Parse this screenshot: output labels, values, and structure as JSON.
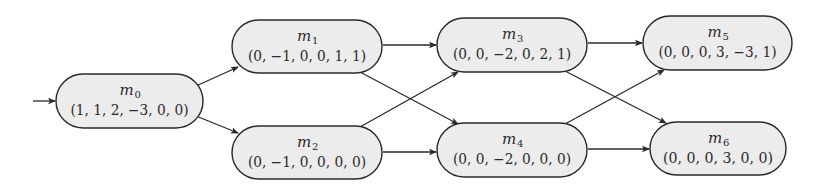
{
  "diagram": {
    "colors": {
      "node_fill": "#ececec",
      "stroke": "#2a2a2a",
      "background": "#ffffff"
    },
    "initial_node": "m0",
    "nodes": [
      {
        "id": "m0",
        "name": "m",
        "sub": "0",
        "vector": "(1, 1, 2, −3, 0, 0)",
        "x": 56,
        "y": 74,
        "w": 147,
        "h": 54
      },
      {
        "id": "m1",
        "name": "m",
        "sub": "1",
        "vector": "(0, −1, 0, 0, 1, 1)",
        "x": 232,
        "y": 20,
        "w": 150,
        "h": 53
      },
      {
        "id": "m2",
        "name": "m",
        "sub": "2",
        "vector": "(0, −1, 0, 0, 0, 0)",
        "x": 232,
        "y": 126,
        "w": 150,
        "h": 53
      },
      {
        "id": "m3",
        "name": "m",
        "sub": "3",
        "vector": "(0, 0, −2, 0, 2, 1)",
        "x": 437,
        "y": 18,
        "w": 150,
        "h": 54
      },
      {
        "id": "m4",
        "name": "m",
        "sub": "4",
        "vector": "(0, 0, −2, 0, 0, 0)",
        "x": 437,
        "y": 123,
        "w": 150,
        "h": 54
      },
      {
        "id": "m5",
        "name": "m",
        "sub": "5",
        "vector": "(0, 0, 0, 3, −3, 1)",
        "x": 643,
        "y": 16,
        "w": 149,
        "h": 54
      },
      {
        "id": "m6",
        "name": "m",
        "sub": "6",
        "vector": "(0, 0, 0, 3, 0, 0)",
        "x": 650,
        "y": 122,
        "w": 136,
        "h": 53
      }
    ],
    "edges": [
      {
        "from": "start",
        "to": "m0",
        "x1": 33,
        "y1": 101,
        "x2": 55,
        "y2": 101
      },
      {
        "from": "m0",
        "to": "m1",
        "x1": 196,
        "y1": 86,
        "x2": 238,
        "y2": 67
      },
      {
        "from": "m0",
        "to": "m2",
        "x1": 196,
        "y1": 116,
        "x2": 238,
        "y2": 133
      },
      {
        "from": "m1",
        "to": "m3",
        "x1": 383,
        "y1": 45,
        "x2": 436,
        "y2": 45
      },
      {
        "from": "m1",
        "to": "m4",
        "x1": 360,
        "y1": 72,
        "x2": 458,
        "y2": 124
      },
      {
        "from": "m2",
        "to": "m3",
        "x1": 360,
        "y1": 127,
        "x2": 458,
        "y2": 72
      },
      {
        "from": "m2",
        "to": "m4",
        "x1": 383,
        "y1": 152,
        "x2": 436,
        "y2": 152
      },
      {
        "from": "m3",
        "to": "m5",
        "x1": 588,
        "y1": 43,
        "x2": 642,
        "y2": 43
      },
      {
        "from": "m3",
        "to": "m6",
        "x1": 565,
        "y1": 71,
        "x2": 666,
        "y2": 123
      },
      {
        "from": "m4",
        "to": "m5",
        "x1": 565,
        "y1": 124,
        "x2": 664,
        "y2": 70
      },
      {
        "from": "m4",
        "to": "m6",
        "x1": 588,
        "y1": 149,
        "x2": 649,
        "y2": 149
      }
    ]
  }
}
